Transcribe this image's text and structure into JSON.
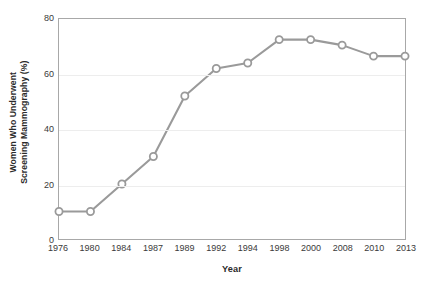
{
  "chart_data": {
    "type": "line",
    "title": "",
    "xlabel": "Year",
    "ylabel": "Women Who Underwent Screening Mammography (%)",
    "ylabel_lines": [
      "Women Who Underwent",
      "Screening Mammography (%)"
    ],
    "categories": [
      "1976",
      "1980",
      "1984",
      "1987",
      "1989",
      "1992",
      "1994",
      "1998",
      "2000",
      "2008",
      "2010",
      "2013"
    ],
    "values": [
      10,
      10,
      20,
      30,
      52,
      62,
      64,
      72.5,
      72.5,
      70.5,
      66.5,
      66.5
    ],
    "series": [
      {
        "name": "Women Who Underwent Screening Mammography (%)",
        "values": [
          10,
          10,
          20,
          30,
          52,
          62,
          64,
          72.5,
          72.5,
          70.5,
          66.5,
          66.5
        ]
      }
    ],
    "ylim": [
      0,
      80
    ],
    "yticks": [
      0,
      20,
      40,
      60,
      80
    ],
    "ytick_labels": [
      "0",
      "20",
      "40",
      "60",
      "80"
    ],
    "xtick_labels": [
      "1976",
      "1980",
      "1984",
      "1987",
      "1989",
      "1992",
      "1994",
      "1998",
      "2000",
      "2008",
      "2010",
      "2013"
    ],
    "grid": true,
    "gridlines_at": [
      20,
      40,
      60
    ],
    "legend": null,
    "legend_position": "none",
    "marker": "open-circle",
    "colors": {
      "line": "#9a9a9a",
      "marker_fill": "#ffffff",
      "marker_stroke": "#9a9a9a",
      "axis": "#a8a8a8",
      "grid": "#ededed",
      "text": "#3a3a3a",
      "title_text": "#2b2b2b",
      "background": "#ffffff"
    }
  }
}
